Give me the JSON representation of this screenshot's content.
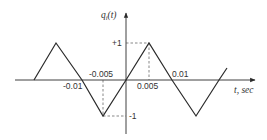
{
  "diagram": {
    "type": "triangular-waveform-plot",
    "y_axis_label": "q",
    "y_axis_label_subscript": "i",
    "y_axis_label_arg": "(t)",
    "x_axis_label": "t, sec",
    "x_ticks": [
      {
        "label": "-0.01",
        "value": -0.01
      },
      {
        "label": "-0.005",
        "value": -0.005
      },
      {
        "label": "0.005",
        "value": 0.005
      },
      {
        "label": "0.01",
        "value": 0.01
      }
    ],
    "y_ticks": [
      {
        "label": "+1",
        "value": 1
      },
      {
        "label": "-1",
        "value": -1
      }
    ],
    "waveform_points": [
      {
        "t": -0.0155,
        "q": 0
      },
      {
        "t": -0.0135,
        "q": 1
      },
      {
        "t": -0.01,
        "q": 0
      },
      {
        "t": -0.005,
        "q": -1
      },
      {
        "t": 0,
        "q": 0
      },
      {
        "t": 0.005,
        "q": 1
      },
      {
        "t": 0.01,
        "q": 0
      },
      {
        "t": 0.015,
        "q": -1
      },
      {
        "t": 0.02,
        "q": 0
      },
      {
        "t": 0.0215,
        "q": 0.3
      }
    ],
    "colors": {
      "line": "#2a2a2a",
      "background": "#ffffff"
    }
  }
}
